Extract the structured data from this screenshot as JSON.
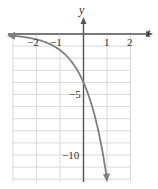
{
  "chart_data": {
    "type": "line",
    "title": "",
    "xlabel": "t",
    "ylabel": "y",
    "xlim": [
      -3,
      2
    ],
    "ylim": [
      -12,
      2
    ],
    "grid": true,
    "x_ticks": [
      -2,
      -1,
      1,
      2
    ],
    "x_tick_labels": [
      "−2",
      "−1",
      "1",
      "2"
    ],
    "y_ticks": [
      -5,
      -10
    ],
    "y_tick_labels": [
      "−5",
      "−10"
    ],
    "series": [
      {
        "name": "y = -4·3^t",
        "x": [
          -3,
          -2.5,
          -2,
          -1.5,
          -1,
          -0.5,
          0,
          0.5,
          1
        ],
        "values": [
          -0.15,
          -0.26,
          -0.44,
          -0.77,
          -1.33,
          -2.31,
          -4,
          -6.93,
          -12
        ],
        "color": "#808080",
        "arrows": "both"
      }
    ],
    "annotations": [
      {
        "text": "−5",
        "x": 0,
        "y": -5
      },
      {
        "text": "−10",
        "x": 0,
        "y": -10
      }
    ]
  },
  "colors": {
    "axis": "#555555",
    "grid": "#d9d9d9",
    "curve": "#808080"
  }
}
